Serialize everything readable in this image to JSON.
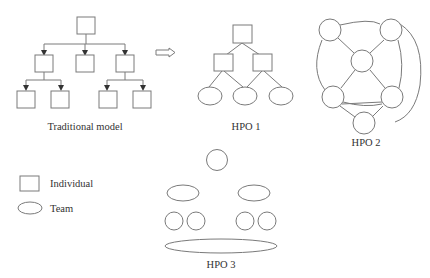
{
  "diagram": {
    "traditional_model": {
      "label": "Traditional model",
      "structure": "hierarchical tree of individuals with downward arrows: 1 root, 3 middle, 4 leaves"
    },
    "transition_arrow": "hollow-right-arrow",
    "hpo1": {
      "label": "HPO 1",
      "structure": "1 individual top, 2 individuals middle, 3 teams bottom"
    },
    "hpo2": {
      "label": "HPO 2",
      "structure": "network of 6 interconnected circular nodes"
    },
    "hpo3": {
      "label": "HPO 3",
      "structure": "1 circle top, 2 team ellipses, 4 small circles, 1 wide team ellipse"
    },
    "legend": {
      "items": [
        {
          "shape": "square",
          "label": "Individual"
        },
        {
          "shape": "ellipse",
          "label": "Team"
        }
      ]
    },
    "colors": {
      "stroke": "#7a7a7a",
      "text": "#333333",
      "background": "#ffffff"
    }
  }
}
